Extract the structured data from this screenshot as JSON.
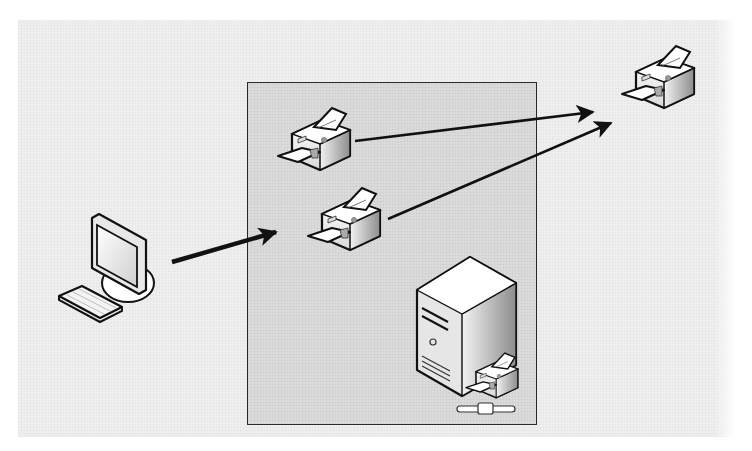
{
  "diagram": {
    "type": "network-printing-diagram",
    "nodes": [
      {
        "id": "client",
        "kind": "workstation",
        "icon": "desktop-computer-icon"
      },
      {
        "id": "logical-printer-1",
        "kind": "printer",
        "icon": "printer-icon",
        "container": "print-server-box"
      },
      {
        "id": "logical-printer-2",
        "kind": "printer",
        "icon": "printer-icon",
        "container": "print-server-box"
      },
      {
        "id": "print-server",
        "kind": "server",
        "icon": "print-server-icon",
        "container": "print-server-box"
      },
      {
        "id": "physical-printer",
        "kind": "printer",
        "icon": "printer-icon"
      }
    ],
    "edges": [
      {
        "from": "client",
        "to": "print-server-box"
      },
      {
        "from": "logical-printer-1",
        "to": "physical-printer"
      },
      {
        "from": "logical-printer-2",
        "to": "physical-printer"
      }
    ],
    "colors": {
      "background": "#efefef",
      "box_fill": "#dcdcdc",
      "stroke": "#111111"
    }
  }
}
